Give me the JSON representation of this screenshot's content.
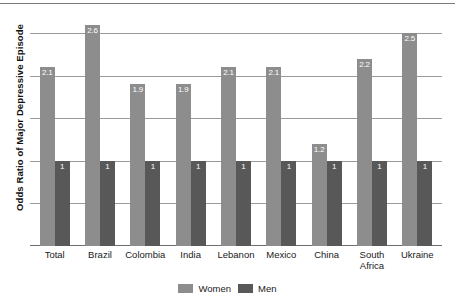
{
  "chart_data": {
    "type": "bar",
    "title": "",
    "xlabel": "",
    "ylabel": "Odds Ratio of Major Depressive Episode",
    "ylim": [
      0,
      2.75
    ],
    "grid": true,
    "gridlines": [
      0.5,
      1.0,
      1.5,
      2.0,
      2.5
    ],
    "legend_position": "bottom",
    "categories": [
      "Total",
      "Brazil",
      "Colombia",
      "India",
      "Lebanon",
      "Mexico",
      "China",
      "South\nAfrica",
      "Ukraine"
    ],
    "series": [
      {
        "name": "Women",
        "color": "#8d8d8d",
        "values": [
          2.1,
          2.6,
          1.9,
          1.9,
          2.1,
          2.1,
          1.2,
          2.2,
          2.5
        ],
        "labels": [
          "2.1",
          "2.6",
          "1.9",
          "1.9",
          "2.1",
          "2.1",
          "1.2",
          "2.2",
          "2.5"
        ]
      },
      {
        "name": "Men",
        "color": "#585858",
        "values": [
          1,
          1,
          1,
          1,
          1,
          1,
          1,
          1,
          1
        ],
        "labels": [
          "1",
          "1",
          "1",
          "1",
          "1",
          "1",
          "1",
          "1",
          "1"
        ]
      }
    ]
  },
  "legend": {
    "women_label": "Women",
    "men_label": "Men"
  }
}
